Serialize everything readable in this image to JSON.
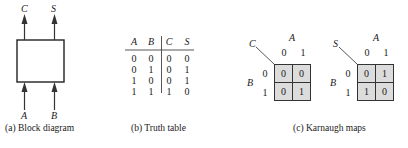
{
  "block_diagram": {
    "outputs": [
      "C",
      "S"
    ],
    "inputs": [
      "A",
      "B"
    ],
    "caption": "(a) Block diagram"
  },
  "truth_table": {
    "headers": [
      "A",
      "B",
      "C",
      "S"
    ],
    "rows": [
      [
        "0",
        "0",
        "0",
        "0"
      ],
      [
        "0",
        "1",
        "0",
        "1"
      ],
      [
        "1",
        "0",
        "0",
        "1"
      ],
      [
        "1",
        "1",
        "1",
        "0"
      ]
    ],
    "caption": "(b) Truth table"
  },
  "karnaugh_maps": {
    "caption": "(c) Karnaugh maps",
    "maps": [
      {
        "output": "C",
        "col_var": "A",
        "row_var": "B",
        "col_labels": [
          "0",
          "1"
        ],
        "row_labels": [
          "0",
          "1"
        ],
        "cells": [
          [
            "0",
            "0"
          ],
          [
            "0",
            "1"
          ]
        ]
      },
      {
        "output": "S",
        "col_var": "A",
        "row_var": "B",
        "col_labels": [
          "0",
          "1"
        ],
        "row_labels": [
          "0",
          "1"
        ],
        "cells": [
          [
            "0",
            "1"
          ],
          [
            "1",
            "0"
          ]
        ]
      }
    ]
  },
  "colors": {
    "line": "#333333",
    "cell_fill": "#dcdcdc"
  }
}
